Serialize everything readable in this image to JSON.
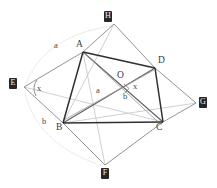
{
  "figure": {
    "type": "geometry-diagram",
    "background_color": "#ffffff",
    "stroke_dark": "#333333",
    "stroke_mid": "#6b6b6b",
    "stroke_light": "#b9b9b9",
    "stroke_faint": "#d2d2d2",
    "label_box_bg": "#262626",
    "label_box_fg": "#f2f2f2"
  },
  "outer_labels": [
    {
      "id": "H",
      "text": "H",
      "x": 104,
      "y": 11
    },
    {
      "id": "E",
      "text": "E",
      "x": 9,
      "y": 78
    },
    {
      "id": "G",
      "text": "G",
      "x": 199,
      "y": 97
    },
    {
      "id": "F",
      "text": "F",
      "x": 101,
      "y": 168
    }
  ],
  "vertex_labels": [
    {
      "id": "A",
      "text": "A",
      "x": 76,
      "y": 47
    },
    {
      "id": "D",
      "text": "D",
      "x": 158,
      "y": 63
    },
    {
      "id": "O",
      "text": "O",
      "x": 117,
      "y": 78
    },
    {
      "id": "B",
      "text": "B",
      "x": 56,
      "y": 130
    },
    {
      "id": "C",
      "text": "C",
      "x": 156,
      "y": 130
    }
  ],
  "measure_labels": [
    {
      "id": "a-outer",
      "text": "a",
      "x": 54,
      "y": 48
    },
    {
      "id": "a-inner",
      "text": "a",
      "x": 96,
      "y": 93
    },
    {
      "id": "b-outer",
      "text": "b",
      "x": 42,
      "y": 124
    },
    {
      "id": "b-inner",
      "text": "b",
      "x": 123,
      "y": 99
    },
    {
      "id": "x-at-E",
      "text": "x",
      "x": 37,
      "y": 91
    },
    {
      "id": "x-at-O",
      "text": "x",
      "x": 133,
      "y": 89
    }
  ],
  "points": {
    "A": {
      "x": 83,
      "y": 52
    },
    "B": {
      "x": 63,
      "y": 123
    },
    "C": {
      "x": 163,
      "y": 122
    },
    "D": {
      "x": 155,
      "y": 68
    },
    "O": {
      "x": 121,
      "y": 88
    },
    "E": {
      "x": 24,
      "y": 87
    },
    "F": {
      "x": 105,
      "y": 165
    },
    "G": {
      "x": 196,
      "y": 103
    },
    "H": {
      "x": 114,
      "y": 24
    }
  },
  "segments_dark": [
    {
      "name": "AB",
      "from": "A",
      "to": "B"
    },
    {
      "name": "AD",
      "from": "A",
      "to": "D"
    },
    {
      "name": "BC",
      "from": "B",
      "to": "C"
    },
    {
      "name": "DC",
      "from": "D",
      "to": "C"
    }
  ],
  "segments_mid": [
    {
      "name": "AC-diagonal",
      "from": "A",
      "to": "C"
    },
    {
      "name": "BD-diagonal",
      "from": "B",
      "to": "D"
    },
    {
      "name": "EA",
      "from": "E",
      "to": "A"
    },
    {
      "name": "EB",
      "from": "E",
      "to": "B"
    },
    {
      "name": "AH",
      "from": "A",
      "to": "H"
    },
    {
      "name": "HD",
      "from": "H",
      "to": "D"
    },
    {
      "name": "DG",
      "from": "D",
      "to": "G"
    },
    {
      "name": "GC",
      "from": "G",
      "to": "C"
    },
    {
      "name": "CF",
      "from": "C",
      "to": "F"
    },
    {
      "name": "FB",
      "from": "F",
      "to": "B"
    }
  ],
  "segments_light": [
    {
      "name": "E-to-C",
      "from": "E",
      "to": "C"
    },
    {
      "name": "B-to-D-ext",
      "from": "B",
      "to": "G"
    },
    {
      "name": "A-to-F",
      "from": "A",
      "to": "F"
    },
    {
      "name": "H-to-B",
      "from": "H",
      "to": "B"
    },
    {
      "name": "A-to-C-light",
      "from": "A",
      "to": "C"
    },
    {
      "name": "B-to-O-light",
      "from": "B",
      "to": "O"
    }
  ],
  "arcs": [
    {
      "name": "arc-a-E-to-H",
      "d": "M 26 84 Q 44 36 112 26"
    },
    {
      "name": "arc-b-E-to-F",
      "d": "M 25 92 Q 38 142 103 166"
    }
  ],
  "angle_marks": [
    {
      "name": "angle-x-at-E",
      "d": "M 38 81 A 16 16 0 0 0 37 95"
    },
    {
      "name": "angle-x-at-O",
      "d": "M 124 85 L 129 89 L 125 93"
    }
  ]
}
